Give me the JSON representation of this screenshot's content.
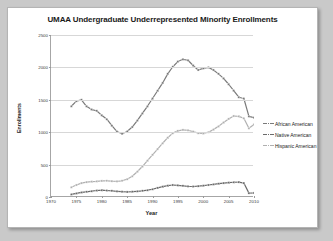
{
  "chart_data": {
    "type": "line",
    "title": "UMAA Undergraduate Underrepresented Minority Enrollments",
    "xlabel": "Year",
    "ylabel": "Enrollments",
    "xlim": [
      1970,
      2010
    ],
    "ylim": [
      0,
      2500
    ],
    "xticks": [
      "1970",
      "1975",
      "1980",
      "1985",
      "1990",
      "1995",
      "2000",
      "2005",
      "2010"
    ],
    "yticks": [
      "0",
      "500",
      "1000",
      "1500",
      "2000",
      "2500"
    ],
    "grid": "horizontal",
    "legend_position": "right",
    "x": [
      1974,
      1975,
      1976,
      1977,
      1978,
      1979,
      1980,
      1981,
      1982,
      1983,
      1984,
      1985,
      1986,
      1987,
      1988,
      1989,
      1990,
      1991,
      1992,
      1993,
      1994,
      1995,
      1996,
      1997,
      1998,
      1999,
      2000,
      2001,
      2002,
      2003,
      2004,
      2005,
      2006,
      2007,
      2008,
      2009,
      2010,
      2011,
      2012,
      2013
    ],
    "series": [
      {
        "name": "African American",
        "color": "#7a7a7a",
        "values": [
          1400,
          1480,
          1500,
          1400,
          1350,
          1330,
          1260,
          1200,
          1100,
          1010,
          975,
          1010,
          1080,
          1180,
          1290,
          1400,
          1520,
          1640,
          1760,
          1900,
          2010,
          2090,
          2125,
          2110,
          2030,
          1960,
          1985,
          2000,
          1960,
          1900,
          1830,
          1740,
          1640,
          1540,
          1520,
          1245,
          1225,
          1250,
          1265,
          1270
        ]
      },
      {
        "name": "Native American",
        "color": "#6b6b6b",
        "values": [
          40,
          55,
          70,
          80,
          90,
          100,
          105,
          100,
          95,
          88,
          82,
          78,
          82,
          88,
          95,
          105,
          120,
          140,
          160,
          175,
          185,
          180,
          172,
          165,
          162,
          168,
          175,
          185,
          195,
          205,
          215,
          222,
          228,
          230,
          215,
          60,
          62,
          66,
          68,
          70
        ]
      },
      {
        "name": "Hispanic American",
        "color": "#b0b0b0",
        "values": [
          150,
          185,
          215,
          230,
          238,
          242,
          248,
          250,
          245,
          242,
          250,
          275,
          320,
          390,
          470,
          560,
          650,
          740,
          830,
          915,
          985,
          1020,
          1035,
          1030,
          1010,
          985,
          980,
          1000,
          1040,
          1090,
          1150,
          1205,
          1250,
          1245,
          1215,
          1060,
          1120,
          1140,
          1145,
          1150
        ]
      }
    ]
  }
}
